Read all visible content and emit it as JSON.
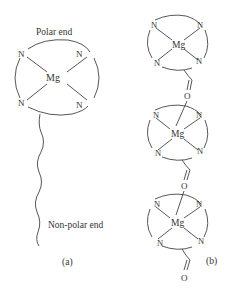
{
  "panel_a": {
    "label": "(a)",
    "polar_label": "Polar end",
    "nonpolar_label": "Non-polar end",
    "ring": {
      "center": "Mg",
      "corners": [
        "N",
        "N",
        "N",
        "N"
      ]
    }
  },
  "panel_b": {
    "label": "(b)",
    "units": [
      {
        "center": "Mg",
        "corners": [
          "N",
          "N",
          "N",
          "N"
        ],
        "link_label": "O"
      },
      {
        "center": "Mg",
        "corners": [
          "N",
          "N",
          "N",
          "N"
        ],
        "link_label": "O"
      },
      {
        "center": "Mg",
        "corners": [
          "N",
          "N",
          "N",
          "N"
        ],
        "link_label": "O"
      }
    ]
  },
  "colors": {
    "line": "#444444",
    "text": "#333333",
    "background": "#ffffff"
  }
}
